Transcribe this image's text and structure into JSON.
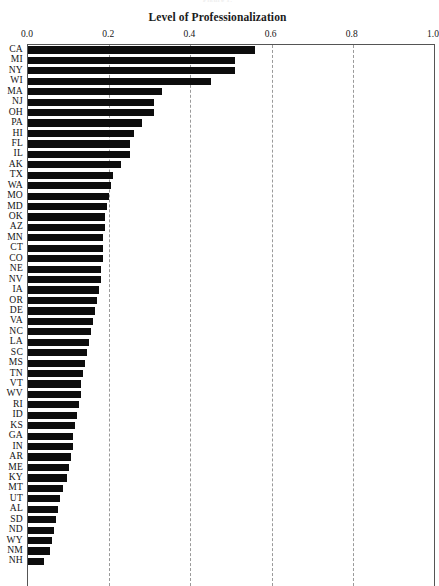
{
  "top_caption": "Figure 1.",
  "chart_title": "Level of Professionalization",
  "axis": {
    "ticks": [
      "0.0",
      "0.2",
      "0.4",
      "0.6",
      "0.8",
      "1.0"
    ],
    "tick_values": [
      0.0,
      0.2,
      0.4,
      0.6,
      0.8,
      1.0
    ]
  },
  "colors": {
    "bar": "#0d0d0d",
    "grid": "#9a9a9a",
    "axis": "#555555",
    "text": "#151515"
  },
  "chart_data": {
    "type": "bar",
    "orientation": "horizontal",
    "title": "Level of Professionalization",
    "xlabel": "",
    "ylabel": "",
    "xlim": [
      0.0,
      1.0
    ],
    "grid": true,
    "legend": false,
    "categories": [
      "CA",
      "MI",
      "NY",
      "WI",
      "MA",
      "NJ",
      "OH",
      "PA",
      "HI",
      "FL",
      "IL",
      "AK",
      "TX",
      "WA",
      "MO",
      "MD",
      "OK",
      "AZ",
      "MN",
      "CT",
      "CO",
      "NE",
      "NV",
      "IA",
      "OR",
      "DE",
      "VA",
      "NC",
      "LA",
      "SC",
      "MS",
      "TN",
      "VT",
      "WV",
      "RI",
      "ID",
      "KS",
      "GA",
      "IN",
      "AR",
      "ME",
      "KY",
      "MT",
      "UT",
      "AL",
      "SD",
      "ND",
      "WY",
      "NM",
      "NH"
    ],
    "values": [
      0.56,
      0.51,
      0.51,
      0.45,
      0.33,
      0.31,
      0.31,
      0.28,
      0.26,
      0.25,
      0.25,
      0.23,
      0.21,
      0.205,
      0.2,
      0.195,
      0.19,
      0.19,
      0.185,
      0.185,
      0.185,
      0.18,
      0.18,
      0.175,
      0.17,
      0.165,
      0.16,
      0.155,
      0.15,
      0.145,
      0.14,
      0.135,
      0.13,
      0.13,
      0.125,
      0.12,
      0.115,
      0.11,
      0.11,
      0.105,
      0.1,
      0.095,
      0.085,
      0.08,
      0.075,
      0.07,
      0.065,
      0.06,
      0.055,
      0.04
    ]
  }
}
